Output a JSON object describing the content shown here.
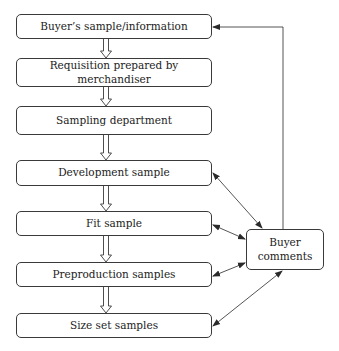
{
  "diagram": {
    "title": "",
    "nodes": [
      {
        "id": "buyer-sample",
        "label": "Buyer’s sample/information"
      },
      {
        "id": "requisition",
        "label": "Requisition prepared by merchandiser"
      },
      {
        "id": "sampling-dept",
        "label": "Sampling department"
      },
      {
        "id": "development",
        "label": "Development sample"
      },
      {
        "id": "fit",
        "label": "Fit sample"
      },
      {
        "id": "preproduction",
        "label": "Preproduction samples"
      },
      {
        "id": "size-set",
        "label": "Size set samples"
      }
    ],
    "comments_node": {
      "id": "buyer-comments",
      "label_line1": "Buyer",
      "label_line2": "comments"
    },
    "edges": [
      {
        "from": "buyer-sample",
        "to": "requisition",
        "style": "hollow-arrow"
      },
      {
        "from": "requisition",
        "to": "sampling-dept",
        "style": "hollow-arrow"
      },
      {
        "from": "sampling-dept",
        "to": "development",
        "style": "hollow-arrow"
      },
      {
        "from": "development",
        "to": "fit",
        "style": "hollow-arrow"
      },
      {
        "from": "fit",
        "to": "preproduction",
        "style": "hollow-arrow"
      },
      {
        "from": "preproduction",
        "to": "size-set",
        "style": "hollow-arrow"
      },
      {
        "from": "development",
        "to": "buyer-comments",
        "style": "bidirectional"
      },
      {
        "from": "fit",
        "to": "buyer-comments",
        "style": "bidirectional"
      },
      {
        "from": "preproduction",
        "to": "buyer-comments",
        "style": "bidirectional"
      },
      {
        "from": "size-set",
        "to": "buyer-comments",
        "style": "bidirectional"
      },
      {
        "from": "buyer-comments",
        "to": "buyer-sample",
        "style": "elbow-arrow"
      }
    ],
    "colors": {
      "stroke": "#3a3a3a",
      "text": "#222222",
      "background": "#ffffff"
    }
  }
}
